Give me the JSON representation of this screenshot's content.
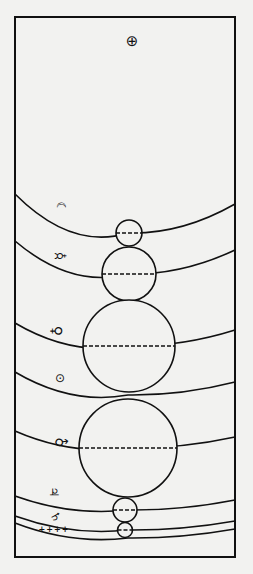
{
  "diagram": {
    "type": "cosmological-orbit-diagram",
    "frame": {
      "left": 15,
      "top": 17,
      "right": 235,
      "bottom": 557
    },
    "center": {
      "symbol": "⊕",
      "name": "Earth",
      "x": 132,
      "y": 41
    },
    "colors": {
      "ink": "#111111",
      "paper": "#f2f2f0"
    },
    "spheres": [
      {
        "name": "Moon",
        "symbol": "☾",
        "label_x": 61,
        "label_y": 208,
        "arc": {
          "left_y": 194,
          "bottom_y": 233,
          "right_y": 204
        },
        "epicycle": {
          "cx": 129,
          "cy": 233,
          "r": 13
        }
      },
      {
        "name": "Mercury",
        "symbol": "☿",
        "label_x": 60,
        "label_y": 256,
        "arc": {
          "left_y": 241,
          "bottom_y": 274,
          "right_y": 250
        },
        "epicycle": {
          "cx": 129,
          "cy": 274,
          "r": 27
        }
      },
      {
        "name": "Venus",
        "symbol": "♀",
        "label_x": 57,
        "label_y": 331,
        "arc": {
          "left_y": 323,
          "bottom_y": 346,
          "right_y": 330
        },
        "epicycle": {
          "cx": 129,
          "cy": 346,
          "r": 46
        }
      },
      {
        "name": "Sun",
        "symbol": "⊙",
        "label_x": 60,
        "label_y": 378,
        "arc": {
          "left_y": 372,
          "bottom_y": 395,
          "right_y": 382
        },
        "epicycle": null
      },
      {
        "name": "Mars",
        "symbol": "♂",
        "label_x": 61,
        "label_y": 443,
        "arc": {
          "left_y": 431,
          "bottom_y": 448,
          "right_y": 437
        },
        "epicycle": {
          "cx": 128,
          "cy": 448,
          "r": 49
        }
      },
      {
        "name": "Jupiter",
        "symbol": "♃",
        "label_x": 54,
        "label_y": 492,
        "arc": {
          "left_y": 496,
          "bottom_y": 510,
          "right_y": 500
        },
        "epicycle": {
          "cx": 125,
          "cy": 510,
          "r": 12
        }
      },
      {
        "name": "Saturn",
        "symbol": "♄",
        "label_x": 56,
        "label_y": 519,
        "arc": {
          "left_y": 516,
          "bottom_y": 530,
          "right_y": 521
        },
        "epicycle": {
          "cx": 125,
          "cy": 530,
          "r": 7.5
        }
      },
      {
        "name": "Fixed stars",
        "symbol": "++++",
        "label_x": 54,
        "label_y": 530,
        "arc": {
          "left_y": 523,
          "bottom_y": 538,
          "right_y": 529
        },
        "epicycle": null
      }
    ]
  },
  "labels": {
    "earth": "⊕",
    "moon": "☾",
    "mercury": "☿",
    "venus": "♀",
    "sun": "⊙",
    "mars": "♂",
    "jupiter": "♃",
    "saturn": "♄",
    "stars": "++++"
  }
}
